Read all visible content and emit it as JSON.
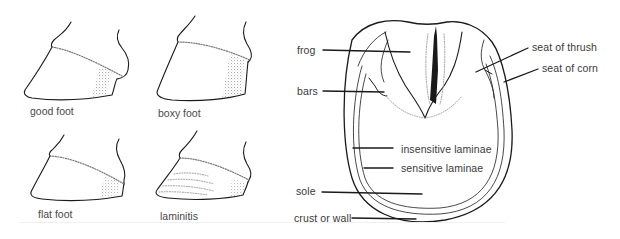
{
  "figure": {
    "left_panel": {
      "title": "hoof shapes",
      "hooves": [
        {
          "id": "good",
          "caption": "good foot"
        },
        {
          "id": "boxy",
          "caption": "boxy foot"
        },
        {
          "id": "flat",
          "caption": "flat foot"
        },
        {
          "id": "laminitis",
          "caption": "laminitis"
        }
      ]
    },
    "right_panel": {
      "title": "underside of hoof",
      "labels": {
        "frog": "frog",
        "bars": "bars",
        "seat_of_thrush": "seat of thrush",
        "seat_of_corn": "seat of corn",
        "insensitive_laminae": "insensitive laminae",
        "sensitive_laminae": "sensitive laminae",
        "sole": "sole",
        "crust_or_wall": "crust or wall"
      }
    },
    "colors": {
      "line": "#1a1a1a",
      "stipple": "#9a9a9a",
      "text": "#3a3a3a",
      "background": "#ffffff"
    }
  }
}
